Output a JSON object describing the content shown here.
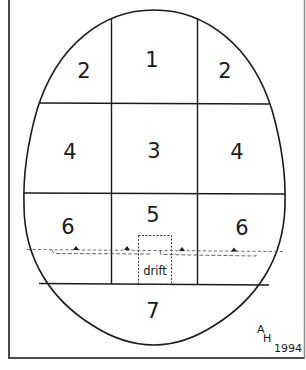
{
  "diagram": {
    "type": "zone-map",
    "shape": "egg-outline",
    "colors": {
      "line": "#1a1a1a",
      "frame": "#555555",
      "background": "#ffffff"
    },
    "zones": [
      {
        "id": "z1",
        "label": "1",
        "position": "top-center"
      },
      {
        "id": "z2l",
        "label": "2",
        "position": "top-left"
      },
      {
        "id": "z2r",
        "label": "2",
        "position": "top-right"
      },
      {
        "id": "z3",
        "label": "3",
        "position": "middle-center"
      },
      {
        "id": "z4l",
        "label": "4",
        "position": "middle-left"
      },
      {
        "id": "z4r",
        "label": "4",
        "position": "middle-right"
      },
      {
        "id": "z5",
        "label": "5",
        "position": "lower-center"
      },
      {
        "id": "z6l",
        "label": "6",
        "position": "lower-left"
      },
      {
        "id": "z6r",
        "label": "6",
        "position": "lower-right"
      },
      {
        "id": "z7",
        "label": "7",
        "position": "bottom"
      }
    ],
    "drift": {
      "label": "drift"
    },
    "signature": {
      "initial_top": "A",
      "initial_bottom": "H",
      "year": "1994"
    }
  }
}
